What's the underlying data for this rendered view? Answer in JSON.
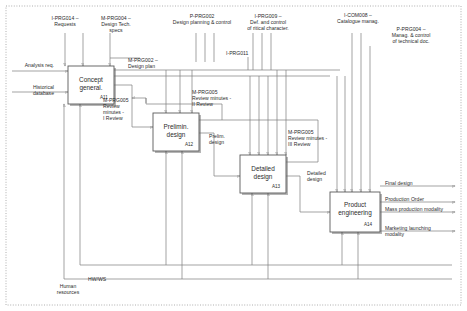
{
  "diagram": {
    "type": "IDEF0 activity model",
    "border_style": "dotted frame"
  },
  "activities": [
    {
      "id": "A11",
      "name": "Concept\ngeneral.",
      "x": 68,
      "y": 66,
      "w": 46,
      "h": 38
    },
    {
      "id": "A12",
      "name": "Prelimin.\ndesign",
      "x": 153,
      "y": 113,
      "w": 46,
      "h": 38
    },
    {
      "id": "A13",
      "name": "Detailed\ndesign",
      "x": 240,
      "y": 155,
      "w": 46,
      "h": 38
    },
    {
      "id": "A14",
      "name": "Product\nengineering",
      "x": 330,
      "y": 192,
      "w": 50,
      "h": 40
    }
  ],
  "controls": [
    {
      "name": "control-requests",
      "text": "I-PRG014 –\nRequests",
      "x": 42,
      "y": 15,
      "w": 46
    },
    {
      "name": "control-design-tech-specs",
      "text": "M-PRG004 –\nDesign Tech.\nspecs",
      "x": 91,
      "y": 15,
      "w": 50
    },
    {
      "name": "control-design-planning",
      "text": "P-PRG002\nDesign planning & control",
      "x": 146,
      "y": 13,
      "w": 112
    },
    {
      "name": "control-critical-character",
      "text": "I-PRG009 –\nDef. and control\nof ritical character.",
      "x": 234,
      "y": 13,
      "w": 68
    },
    {
      "name": "control-prg011",
      "text": "I-PRG011",
      "x": 226,
      "y": 50,
      "w": 36
    },
    {
      "name": "control-catalogue-manag",
      "text": "I-COM008 –\nCatalogue manag.",
      "x": 330,
      "y": 12,
      "w": 56
    },
    {
      "name": "control-technical-doc",
      "text": "P-PRG004 –\nManag. & control\nof technical doc.",
      "x": 380,
      "y": 26,
      "w": 62
    }
  ],
  "flows": [
    {
      "name": "input-analysis-req",
      "text": "Analysis req.",
      "x": 10,
      "y": 62,
      "w": 44,
      "align": "left"
    },
    {
      "name": "input-historical-database",
      "text": "Historical\ndatabase",
      "x": 10,
      "y": 84,
      "w": 44,
      "align": "left"
    },
    {
      "name": "flow-design-plan",
      "text": "M-PRG002 –\nDesign plan",
      "x": 128,
      "y": 57,
      "w": 56,
      "align": "left"
    },
    {
      "name": "flow-review-minutes-i",
      "text": "M-PRG005\nReview\nminutes -\nI Review",
      "x": 103,
      "y": 97,
      "w": 40,
      "align": "left"
    },
    {
      "name": "flow-review-minutes-ii",
      "text": "M-PRG005\nReview minutes -\nII Review",
      "x": 192,
      "y": 89,
      "w": 62,
      "align": "left"
    },
    {
      "name": "flow-review-minutes-iii",
      "text": "M-PRG005\nReview minutes -\nIII Review",
      "x": 288,
      "y": 129,
      "w": 62,
      "align": "left"
    },
    {
      "name": "flow-prelim-design",
      "text": "Prelim.\ndesign",
      "x": 209,
      "y": 133,
      "w": 30,
      "align": "left"
    },
    {
      "name": "flow-detailed-design",
      "text": "Detailed\ndesign",
      "x": 307,
      "y": 170,
      "w": 30,
      "align": "left"
    }
  ],
  "outputs": [
    {
      "name": "output-final-design",
      "text": "Final design",
      "x": 385,
      "y": 182
    },
    {
      "name": "output-production-order",
      "text": "Production Order",
      "x": 385,
      "y": 198
    },
    {
      "name": "output-mass-production",
      "text": "Mass production modality",
      "x": 385,
      "y": 209
    },
    {
      "name": "output-marketing-launching",
      "text": "Marketing launching\nmodality",
      "x": 385,
      "y": 227
    }
  ],
  "mechanisms": [
    {
      "name": "mechanism-human-resources",
      "text": "Human\nresources",
      "x": 46,
      "y": 283,
      "w": 44
    },
    {
      "name": "mechanism-hw-ws",
      "text": "HW/WS",
      "x": 88,
      "y": 276,
      "w": 32
    }
  ],
  "colors": {
    "line": "#7d7d7d",
    "box_border": "#5a5a5a",
    "box_shadow": "#6b6b6b",
    "text": "#2b2b2b",
    "frame": "#9a9a9a"
  }
}
